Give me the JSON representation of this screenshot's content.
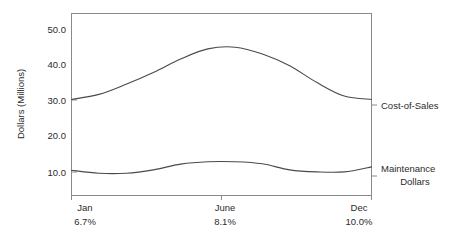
{
  "chart_data": {
    "type": "line",
    "title": "",
    "xlabel": "",
    "ylabel": "Dollars (Millions)",
    "ylim": [
      0,
      54
    ],
    "xlim": [
      0,
      11
    ],
    "grid": false,
    "legend_position": "right-inline",
    "y_ticks": [
      "50.0",
      "40.0",
      "30.0",
      "20.0",
      "10.0"
    ],
    "y_tick_values": [
      50.0,
      40.0,
      30.0,
      20.0,
      10.0
    ],
    "categories": [
      "Jan",
      "June",
      "Dec"
    ],
    "x_tick_labels": [
      "Jan",
      "June",
      "Dec"
    ],
    "x_tick_sublabels": [
      "6.7%",
      "8.1%",
      "10.0%"
    ],
    "x_tick_positions": [
      0,
      5,
      11
    ],
    "series": [
      {
        "name": "Cost-of-Sales",
        "x": [
          0,
          1,
          2,
          3,
          4,
          5,
          6,
          7,
          8,
          9,
          10,
          11
        ],
        "values": [
          28.5,
          30.0,
          33.0,
          36.5,
          40.5,
          43.5,
          44.0,
          42.0,
          38.5,
          33.5,
          29.5,
          28.5
        ]
      },
      {
        "name": "Maintenance Dollars",
        "x": [
          0,
          1,
          2,
          3,
          4,
          5,
          6,
          7,
          8,
          9,
          10,
          11
        ],
        "values": [
          7.5,
          6.6,
          6.6,
          7.6,
          9.3,
          10.0,
          10.0,
          9.4,
          7.6,
          7.0,
          7.0,
          8.5
        ]
      }
    ]
  },
  "labels": {
    "y_axis_title": "Dollars (Millions)",
    "series_one": "Cost-of-Sales",
    "series_two_line1": "Maintenance",
    "series_two_line2": "Dollars"
  },
  "colors": {
    "background": "#ffffff",
    "frame": "#8a8a8a",
    "line": "#4a4a4a",
    "text": "#2b2b2b"
  }
}
